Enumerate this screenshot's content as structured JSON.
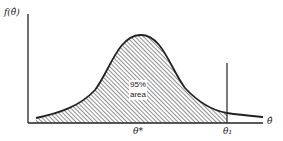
{
  "diagram": {
    "y_axis_label": "f(θ̂)",
    "x_axis_label": "θ̂",
    "center_label": "θ*",
    "threshold_label": "θ₁",
    "area_label_line1": "95%",
    "area_label_line2": "area"
  },
  "colors": {
    "line": "#222222",
    "hatch": "#333333",
    "background": "#ffffff"
  }
}
